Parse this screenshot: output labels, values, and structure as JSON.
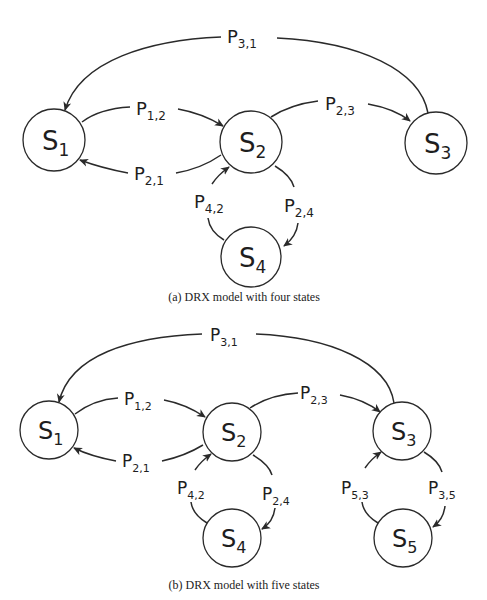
{
  "figures": [
    {
      "id": "a",
      "caption": "(a) DRX model with four states",
      "states": [
        {
          "name": "S",
          "sub": "1"
        },
        {
          "name": "S",
          "sub": "2"
        },
        {
          "name": "S",
          "sub": "3"
        },
        {
          "name": "S",
          "sub": "4"
        }
      ],
      "transitions": [
        {
          "from": "S1",
          "to": "S2",
          "label": "P",
          "sub": "1,2"
        },
        {
          "from": "S2",
          "to": "S1",
          "label": "P",
          "sub": "2,1"
        },
        {
          "from": "S2",
          "to": "S3",
          "label": "P",
          "sub": "2,3"
        },
        {
          "from": "S3",
          "to": "S1",
          "label": "P",
          "sub": "3,1"
        },
        {
          "from": "S2",
          "to": "S4",
          "label": "P",
          "sub": "2,4"
        },
        {
          "from": "S4",
          "to": "S2",
          "label": "P",
          "sub": "4,2"
        }
      ]
    },
    {
      "id": "b",
      "caption": "(b) DRX model with five states",
      "states": [
        {
          "name": "S",
          "sub": "1"
        },
        {
          "name": "S",
          "sub": "2"
        },
        {
          "name": "S",
          "sub": "3"
        },
        {
          "name": "S",
          "sub": "4"
        },
        {
          "name": "S",
          "sub": "5"
        }
      ],
      "transitions": [
        {
          "from": "S1",
          "to": "S2",
          "label": "P",
          "sub": "1,2"
        },
        {
          "from": "S2",
          "to": "S1",
          "label": "P",
          "sub": "2,1"
        },
        {
          "from": "S2",
          "to": "S3",
          "label": "P",
          "sub": "2,3"
        },
        {
          "from": "S3",
          "to": "S1",
          "label": "P",
          "sub": "3,1"
        },
        {
          "from": "S2",
          "to": "S4",
          "label": "P",
          "sub": "2,4"
        },
        {
          "from": "S4",
          "to": "S2",
          "label": "P",
          "sub": "4,2"
        },
        {
          "from": "S3",
          "to": "S5",
          "label": "P",
          "sub": "3,5"
        },
        {
          "from": "S5",
          "to": "S3",
          "label": "P",
          "sub": "5,3"
        }
      ]
    }
  ],
  "colors": {
    "stroke": "#2a2a2a",
    "text": "#1e1e1e",
    "background": "#ffffff"
  }
}
